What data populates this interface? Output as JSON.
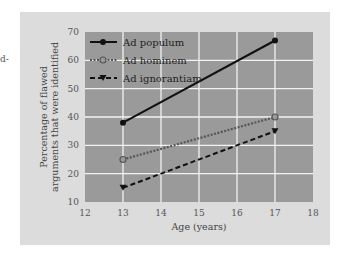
{
  "edge_fragment": "d-",
  "chart_data": {
    "type": "line",
    "title": "",
    "xlabel": "Age (years)",
    "ylabel": "Percentage of flawed arguments that were identified",
    "ylabel_lines": [
      "Percentage of flawed",
      "arguments that were identified"
    ],
    "xlim": [
      12,
      18
    ],
    "ylim": [
      10,
      70
    ],
    "xticks": [
      12,
      13,
      14,
      15,
      16,
      17,
      18
    ],
    "yticks": [
      10,
      20,
      30,
      40,
      50,
      60,
      70
    ],
    "grid": true,
    "legend_position": "upper left",
    "x": [
      13,
      17
    ],
    "series": [
      {
        "name": "Ad populum",
        "values": [
          38,
          67
        ],
        "style": "solid",
        "marker": "filled-circle"
      },
      {
        "name": "Ad hominem",
        "values": [
          25,
          40
        ],
        "style": "dotted",
        "marker": "open-circle"
      },
      {
        "name": "Ad ignorantiam",
        "values": [
          15,
          35
        ],
        "style": "dashed",
        "marker": "filled-triangle-down"
      }
    ],
    "colors": {
      "panel_bg": "#dcdcdc",
      "plot_bg": "#9a9a9a",
      "grid": "#f2f2f2",
      "line": "#111111"
    }
  }
}
